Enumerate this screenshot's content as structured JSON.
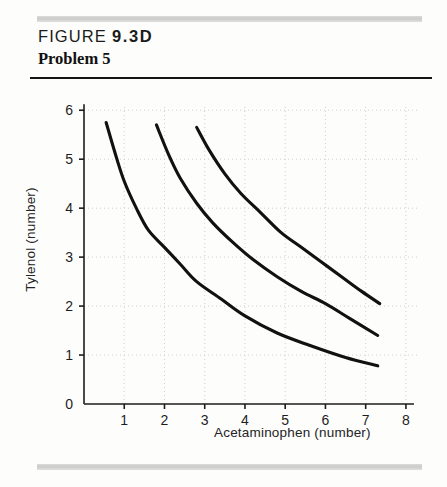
{
  "figure": {
    "label": "FIGURE",
    "number": "9.3D",
    "problem_title": "Problem 5"
  },
  "chart_data": {
    "type": "line",
    "title": "Problem 5",
    "xlabel": "Acetaminophen (number)",
    "ylabel": "Tylenol (number)",
    "xlim": [
      0,
      8.35
    ],
    "ylim": [
      0,
      6.25
    ],
    "xticks": [
      0,
      1,
      2,
      3,
      4,
      5,
      6,
      7,
      8
    ],
    "yticks": [
      0,
      1,
      2,
      3,
      4,
      5,
      6
    ],
    "xtick_labels": [
      "0",
      "1",
      "2",
      "3",
      "4",
      "5",
      "6",
      "7",
      "8"
    ],
    "ytick_labels": [
      "0",
      "1",
      "2",
      "3",
      "4",
      "5",
      "6"
    ],
    "grid": true,
    "grid_style": "dotted",
    "legend": "none",
    "curve_family": "indifference curves (hyperbolas, x*y = k)",
    "series": [
      {
        "name": "Indifference curve 1 (lowest)",
        "k": 5.7,
        "x_start": 0.55,
        "x_end": 7.3,
        "points": [
          {
            "x": 0.55,
            "y": 5.75
          },
          {
            "x": 0.8,
            "y": 5.05
          },
          {
            "x": 1.0,
            "y": 4.55
          },
          {
            "x": 1.3,
            "y": 4.0
          },
          {
            "x": 1.6,
            "y": 3.55
          },
          {
            "x": 2.0,
            "y": 3.2
          },
          {
            "x": 2.4,
            "y": 2.85
          },
          {
            "x": 2.8,
            "y": 2.5
          },
          {
            "x": 3.4,
            "y": 2.15
          },
          {
            "x": 4.0,
            "y": 1.8
          },
          {
            "x": 4.8,
            "y": 1.45
          },
          {
            "x": 5.6,
            "y": 1.2
          },
          {
            "x": 6.5,
            "y": 0.95
          },
          {
            "x": 7.3,
            "y": 0.78
          }
        ]
      },
      {
        "name": "Indifference curve 2 (middle)",
        "k": 10.2,
        "x_start": 1.8,
        "x_end": 7.3,
        "points": [
          {
            "x": 1.8,
            "y": 5.7
          },
          {
            "x": 2.1,
            "y": 5.1
          },
          {
            "x": 2.4,
            "y": 4.6
          },
          {
            "x": 2.8,
            "y": 4.1
          },
          {
            "x": 3.2,
            "y": 3.7
          },
          {
            "x": 3.7,
            "y": 3.3
          },
          {
            "x": 4.2,
            "y": 2.95
          },
          {
            "x": 4.8,
            "y": 2.6
          },
          {
            "x": 5.4,
            "y": 2.3
          },
          {
            "x": 6.0,
            "y": 2.05
          },
          {
            "x": 6.6,
            "y": 1.75
          },
          {
            "x": 7.3,
            "y": 1.4
          }
        ]
      },
      {
        "name": "Indifference curve 3 (highest)",
        "k": 15.0,
        "x_start": 2.8,
        "x_end": 7.35,
        "points": [
          {
            "x": 2.8,
            "y": 5.65
          },
          {
            "x": 3.1,
            "y": 5.2
          },
          {
            "x": 3.5,
            "y": 4.7
          },
          {
            "x": 3.9,
            "y": 4.3
          },
          {
            "x": 4.4,
            "y": 3.9
          },
          {
            "x": 4.9,
            "y": 3.5
          },
          {
            "x": 5.4,
            "y": 3.2
          },
          {
            "x": 5.9,
            "y": 2.9
          },
          {
            "x": 6.4,
            "y": 2.6
          },
          {
            "x": 6.9,
            "y": 2.3
          },
          {
            "x": 7.35,
            "y": 2.05
          }
        ]
      }
    ],
    "colors": {
      "curve": "#111111",
      "axis": "#1d1d1d",
      "grid": "#cfcfcf",
      "background": "#fdfdfc"
    }
  }
}
